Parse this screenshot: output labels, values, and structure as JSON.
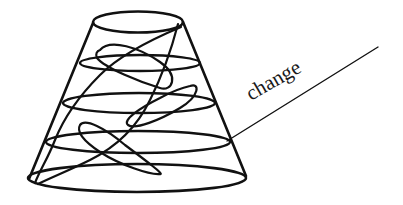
{
  "figure": {
    "stroke_color": "#111111",
    "background_color": "#ffffff"
  },
  "annotation": {
    "label": "change"
  }
}
